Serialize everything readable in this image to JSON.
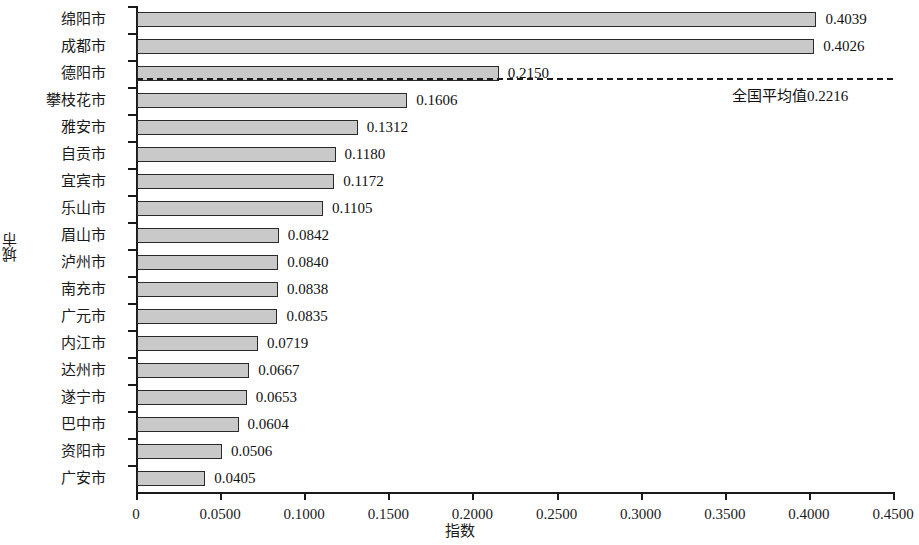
{
  "chart_data": {
    "type": "bar",
    "orientation": "horizontal",
    "title": "",
    "xlabel": "指数",
    "ylabel": "城市",
    "xlim": [
      0,
      0.45
    ],
    "xticks": [
      "0",
      "0.0500",
      "0.1000",
      "0.1500",
      "0.2000",
      "0.2500",
      "0.3000",
      "0.3500",
      "0.4000",
      "0.4500"
    ],
    "xtick_values": [
      0,
      0.05,
      0.1,
      0.15,
      0.2,
      0.25,
      0.3,
      0.35,
      0.4,
      0.45
    ],
    "grid": false,
    "legend": null,
    "categories": [
      "绵阳市",
      "成都市",
      "德阳市",
      "攀枝花市",
      "雅安市",
      "自贡市",
      "宜宾市",
      "乐山市",
      "眉山市",
      "泸州市",
      "南充市",
      "广元市",
      "内江市",
      "达州市",
      "遂宁市",
      "巴中市",
      "资阳市",
      "广安市"
    ],
    "values": [
      0.4039,
      0.4026,
      0.215,
      0.1606,
      0.1312,
      0.118,
      0.1172,
      0.1105,
      0.0842,
      0.084,
      0.0838,
      0.0835,
      0.0719,
      0.0667,
      0.0653,
      0.0604,
      0.0506,
      0.0405
    ],
    "value_labels": [
      "0.4039",
      "0.4026",
      "0.2150",
      "0.1606",
      "0.1312",
      "0.1180",
      "0.1172",
      "0.1105",
      "0.0842",
      "0.0840",
      "0.0838",
      "0.0835",
      "0.0719",
      "0.0667",
      "0.0653",
      "0.0604",
      "0.0506",
      "0.0405"
    ],
    "annotations": [
      {
        "name": "national-average-line",
        "kind": "reference-line-horizontal",
        "value": 0.2216,
        "label": "全国平均值0.2216",
        "style": "dashed"
      }
    ],
    "bar_fill_color": "#c9c9c9",
    "bar_edge_color": "#2a2a2a",
    "axis_color": "#1a1a1a"
  }
}
